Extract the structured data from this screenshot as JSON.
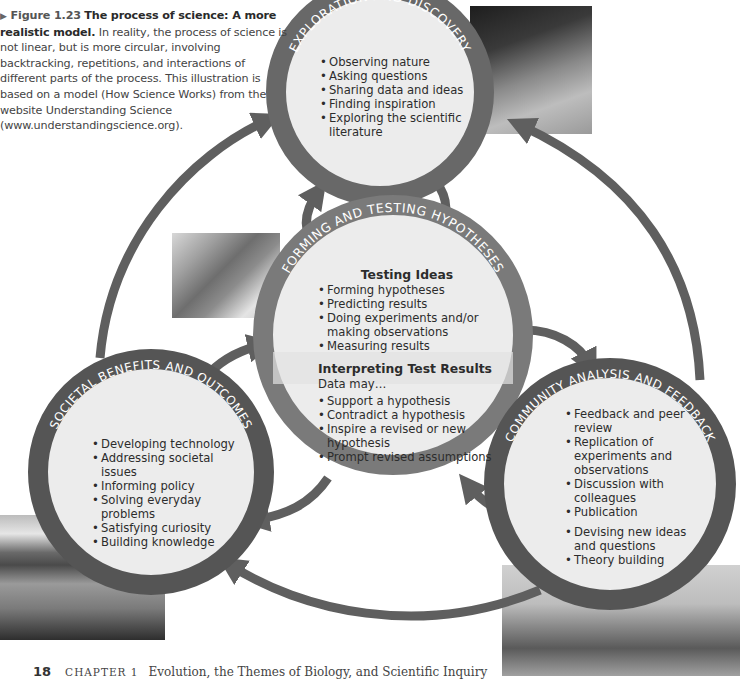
{
  "caption": {
    "figure_label": "Figure 1.23",
    "title": "The process of science: A more realistic model.",
    "body": "In reality, the process of science is not linear, but is more circular, involving backtracking, repetitions, and interactions of different parts of the process. This illustration is based on a model (How Science Works) from the website Understanding Science (www.understandingscience.org)."
  },
  "colors": {
    "ring": "#686868",
    "ring_light": "#7a7a7a",
    "circle_fill": "#ececec",
    "arrow": "#5f5f5f",
    "ring_text": "#ffffff",
    "body_text": "#2c2c2c"
  },
  "nodes": {
    "exploration": {
      "title": "EXPLORATION AND DISCOVERY",
      "items": [
        "Observing nature",
        "Asking questions",
        "Sharing data and ideas",
        "Finding inspiration",
        "Exploring the scientific literature"
      ]
    },
    "testing": {
      "title": "FORMING AND TESTING HYPOTHESES",
      "section1_title": "Testing Ideas",
      "section1_items": [
        "Forming hypotheses",
        "Predicting results",
        "Doing experiments and/or making observations",
        "Measuring results"
      ],
      "section2_title": "Interpreting Test Results",
      "section2_note": "Data may…",
      "section2_items": [
        "Support a hypothesis",
        "Contradict a hypothesis",
        "Inspire a revised or new hypothesis",
        "Prompt revised assumptions"
      ]
    },
    "societal": {
      "title": "SOCIETAL BENEFITS AND OUTCOMES",
      "items": [
        "Developing technology",
        "Addressing societal issues",
        "Informing policy",
        "Solving everyday problems",
        "Satisfying curiosity",
        "Building knowledge"
      ]
    },
    "community": {
      "title": "COMMUNITY ANALYSIS AND FEEDBACK",
      "items": [
        "Feedback and peer review",
        "Replication of experiments and observations",
        "Discussion with colleagues",
        "Publication"
      ],
      "items2": [
        "Devising new ideas and questions",
        "Theory building"
      ]
    }
  },
  "photos": [
    {
      "name": "student-with-net-photo",
      "subject": "student with dip net"
    },
    {
      "name": "lab-researcher-photo",
      "subject": "researcher writing in lab"
    },
    {
      "name": "canoe-photo",
      "subject": "person in canoe on lake"
    },
    {
      "name": "seminar-photo",
      "subject": "group discussion in classroom"
    }
  ],
  "footer": {
    "page_number": "18",
    "chapter": "CHAPTER 1",
    "chapter_title": "Evolution, the Themes of Biology, and Scientific Inquiry"
  }
}
